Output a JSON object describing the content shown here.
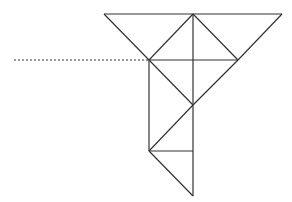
{
  "diagram": {
    "stroke_color": "#333333",
    "background": "#ffffff",
    "points": {
      "A": [
        104,
        14
      ],
      "B": [
        193,
        14
      ],
      "C": [
        282,
        14
      ],
      "D": [
        149,
        60
      ],
      "E": [
        193,
        60
      ],
      "F": [
        238,
        60
      ],
      "G": [
        193,
        105
      ],
      "H": [
        149,
        151
      ],
      "I": [
        193,
        151
      ],
      "J": [
        193,
        196
      ]
    },
    "segments": [
      [
        "A",
        "C"
      ],
      [
        "A",
        "D"
      ],
      [
        "C",
        "F"
      ],
      [
        "B",
        "D"
      ],
      [
        "B",
        "F"
      ],
      [
        "B",
        "G"
      ],
      [
        "D",
        "F"
      ],
      [
        "D",
        "G"
      ],
      [
        "F",
        "G"
      ],
      [
        "D",
        "H"
      ],
      [
        "G",
        "H"
      ],
      [
        "G",
        "I"
      ],
      [
        "H",
        "I"
      ],
      [
        "H",
        "J"
      ],
      [
        "I",
        "J"
      ]
    ],
    "dotted_line": {
      "from": [
        14,
        60
      ],
      "to": [
        149,
        60
      ]
    }
  }
}
